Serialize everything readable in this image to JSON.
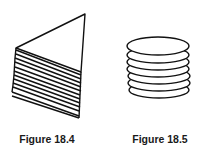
{
  "figures": [
    {
      "caption": "Figure 18.4",
      "description": "Triangular top sheet over a skewed stack of flat sheets",
      "sheet_count": 12
    },
    {
      "caption": "Figure 18.5",
      "description": "Vertical stack of circular discs",
      "disc_count": 7
    }
  ],
  "colors": {
    "stroke": "#111111",
    "background": "#ffffff",
    "caption": "#1a1a1a"
  }
}
